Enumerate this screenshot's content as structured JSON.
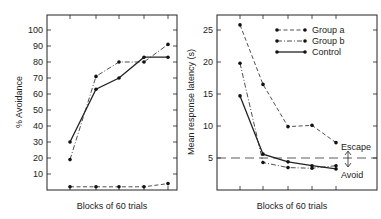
{
  "chart_data": [
    {
      "type": "line",
      "title": "",
      "xlabel": "Blocks of 60 trials",
      "ylabel": "% Avoidance",
      "ylim": [
        0,
        105
      ],
      "yticks": [
        10,
        20,
        30,
        40,
        50,
        60,
        70,
        80,
        90,
        100
      ],
      "x": [
        1,
        2,
        3,
        4,
        5
      ],
      "series": [
        {
          "name": "Group a",
          "style": "dashed",
          "values": [
            2,
            2,
            2,
            2,
            4
          ]
        },
        {
          "name": "Group b",
          "style": "dash-dot",
          "values": [
            19,
            71,
            80,
            80,
            91
          ]
        },
        {
          "name": "Control",
          "style": "solid",
          "values": [
            30,
            63,
            70,
            83,
            83
          ]
        }
      ]
    },
    {
      "type": "line",
      "title": "",
      "xlabel": "Blocks of 60 trials",
      "ylabel": "Mean response latency (s)",
      "ylim": [
        0,
        28
      ],
      "yticks": [
        5,
        10,
        15,
        20,
        25
      ],
      "x": [
        1,
        2,
        3,
        4,
        5
      ],
      "series": [
        {
          "name": "Group a",
          "style": "dashed",
          "values": [
            25.8,
            16.5,
            9.9,
            10.1,
            7.4
          ]
        },
        {
          "name": "Group b",
          "style": "dash-dot",
          "values": [
            19.8,
            4.3,
            3.5,
            3.4,
            3.8
          ]
        },
        {
          "name": "Control",
          "style": "solid",
          "values": [
            14.7,
            5.6,
            4.4,
            3.8,
            3.3
          ]
        }
      ],
      "legend": {
        "position": "upper right",
        "entries": [
          "Group a",
          "Group b",
          "Control"
        ]
      },
      "annotations": [
        {
          "text": "Escape",
          "note": "above 5 s reference line"
        },
        {
          "text": "Avoid",
          "note": "below 5 s reference line"
        }
      ],
      "reference_line": {
        "y": 5,
        "style": "long-dash"
      }
    }
  ],
  "left": {
    "ylabel": "% Avoidance",
    "xlabel": "Blocks of 60 trials",
    "ytick_labels": [
      "100",
      "90",
      "80",
      "70",
      "60",
      "50",
      "40",
      "30",
      "20",
      "10"
    ]
  },
  "right": {
    "ylabel": "Mean response latency (s)",
    "xlabel": "Blocks of 60 trials",
    "ytick_labels": [
      "25",
      "20",
      "15",
      "10",
      "5"
    ],
    "legend": [
      "Group a",
      "Group b",
      "Control"
    ],
    "escape_label": "Escape",
    "avoid_label": "Avoid"
  }
}
